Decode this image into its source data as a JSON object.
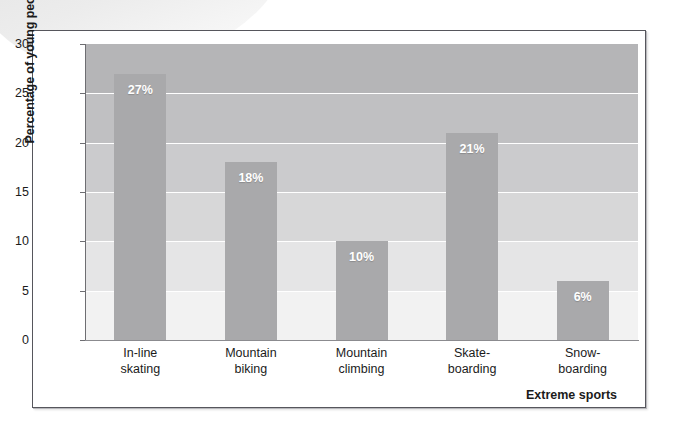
{
  "chart_data": {
    "type": "bar",
    "title": "",
    "xlabel": "Extreme sports",
    "ylabel": "Percentage of young people",
    "categories": [
      "In-line skating",
      "Mountain biking",
      "Mountain climbing",
      "Skate-boarding",
      "Snow-boarding"
    ],
    "category_lines": [
      [
        "In-line",
        "skating"
      ],
      [
        "Mountain",
        "biking"
      ],
      [
        "Mountain",
        "climbing"
      ],
      [
        "Skate-",
        "boarding"
      ],
      [
        "Snow-",
        "boarding"
      ]
    ],
    "values": [
      27,
      18,
      10,
      21,
      6
    ],
    "value_labels": [
      "27%",
      "18%",
      "10%",
      "21%",
      "6%"
    ],
    "ylim": [
      0,
      30
    ],
    "ytick_values": [
      0,
      5,
      10,
      15,
      20,
      25,
      30
    ],
    "ytick_labels": [
      "0",
      "5",
      "10",
      "15",
      "20",
      "25",
      "30"
    ],
    "grid": true,
    "grid_color": "#ffffff",
    "legend": "none",
    "bar_color": "#a9a9ab",
    "value_label_color": "#ffffff",
    "background_gradient": [
      "#b5b5b7",
      "#c0c0c2",
      "#cbcbcd",
      "#d7d7d8",
      "#e5e5e6",
      "#f2f2f2",
      "#fcfcfc"
    ],
    "frame_color": "#56565c",
    "axis_color": "#6e6e72",
    "text_color": "#1b1b1b"
  }
}
